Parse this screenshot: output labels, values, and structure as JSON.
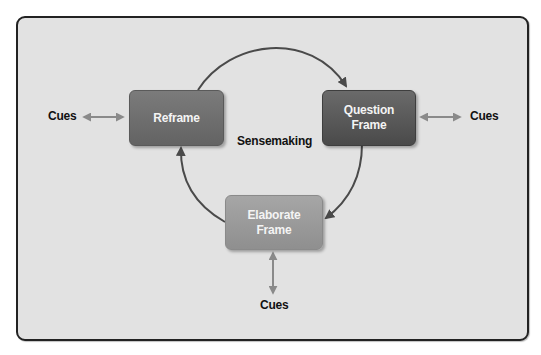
{
  "diagram": {
    "center_label": "Sensemaking",
    "nodes": [
      {
        "id": "reframe",
        "label_lines": [
          "Reframe"
        ],
        "color": "#6e6e6e"
      },
      {
        "id": "question-frame",
        "label_lines": [
          "Question",
          "Frame"
        ],
        "color": "#555555"
      },
      {
        "id": "elaborate-frame",
        "label_lines": [
          "Elaborate",
          "Frame"
        ],
        "color": "#9a9a9a"
      }
    ],
    "cues": {
      "left": "Cues",
      "right": "Cues",
      "bottom": "Cues"
    },
    "cycle_edges": [
      {
        "from": "reframe",
        "to": "question-frame"
      },
      {
        "from": "question-frame",
        "to": "elaborate-frame"
      },
      {
        "from": "elaborate-frame",
        "to": "reframe"
      }
    ],
    "cue_edges": [
      {
        "between": [
          "cues-left",
          "reframe"
        ],
        "bidirectional": true
      },
      {
        "between": [
          "question-frame",
          "cues-right"
        ],
        "bidirectional": true
      },
      {
        "between": [
          "elaborate-frame",
          "cues-bottom"
        ],
        "bidirectional": true
      }
    ],
    "colors": {
      "background": "#e2e2e2",
      "border": "#222222",
      "cycle_arrow": "#4a4a4a",
      "cue_arrow": "#8a8a8a"
    }
  }
}
